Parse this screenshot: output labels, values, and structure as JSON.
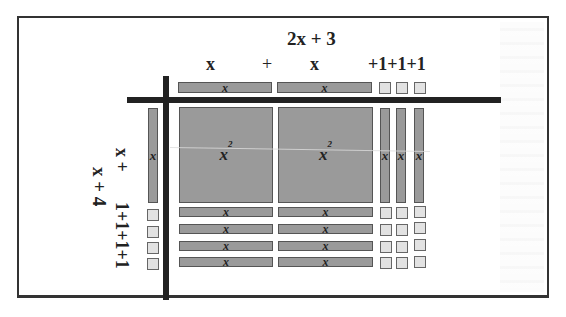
{
  "diagram": {
    "top_factor": {
      "expression": "2x  + 3",
      "terms": [
        "x",
        "+",
        "x",
        "+1+1+1"
      ]
    },
    "left_factor": {
      "expression": "x  + 4",
      "terms": [
        "x  +",
        "1+1+1+1"
      ]
    },
    "tile_labels": {
      "x_squared": "x",
      "x_squared_exp": "2",
      "x": "x"
    },
    "top_row_tiles": [
      "x",
      "x",
      "1",
      "1",
      "1"
    ],
    "left_column_tiles": [
      "x",
      "1",
      "1",
      "1",
      "1"
    ],
    "product_grid": {
      "rows": [
        [
          "x^2",
          "x^2",
          "x",
          "x",
          "x"
        ],
        [
          "x",
          "x",
          "1",
          "1",
          "1"
        ],
        [
          "x",
          "x",
          "1",
          "1",
          "1"
        ],
        [
          "x",
          "x",
          "1",
          "1",
          "1"
        ],
        [
          "x",
          "x",
          "1",
          "1",
          "1"
        ]
      ]
    },
    "colors": {
      "variable_tile": "#9a9a9a",
      "unit_tile": "#e2e2e2",
      "axis_lines": "#222222",
      "frame": "#333333"
    }
  }
}
